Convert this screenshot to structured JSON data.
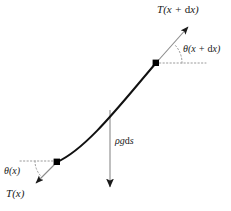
{
  "diagram": {
    "background_color": "#ffffff",
    "width": 231,
    "height": 211,
    "curve_color": "#111111",
    "arrow_color": "#8a8a8a",
    "dotted_color": "#9a9a9a",
    "node_color": "#000000",
    "text_color": "#1a1a1a",
    "labels": {
      "tension_upper": "T(x + dx)",
      "tension_lower": "T(x)",
      "angle_upper": "θ(x + dx)",
      "angle_lower": "θ(x)",
      "weight": "ρgds"
    },
    "label_parts": {
      "tension_upper": {
        "fn": "T",
        "open": "(",
        "var": "x",
        "plus": " + ",
        "d": "d",
        "dvar": "x",
        "close": ")"
      },
      "tension_lower": {
        "fn": "T",
        "open": "(",
        "var": "x",
        "close": ")"
      },
      "angle_upper": {
        "fn": "θ",
        "open": "(",
        "var": "x",
        "plus": " + ",
        "d": "d",
        "dvar": "x",
        "close": ")"
      },
      "angle_lower": {
        "fn": "θ",
        "open": "(",
        "var": "x",
        "close": ")"
      },
      "weight": {
        "rho": "ρ",
        "g": "g",
        "d": "d",
        "s": "s"
      }
    },
    "geometry": {
      "node_lower": {
        "x": 57,
        "y": 162
      },
      "node_upper": {
        "x": 156,
        "y": 63
      },
      "curve_control_1": {
        "x": 88,
        "y": 148
      },
      "curve_control_2": {
        "x": 124,
        "y": 100
      },
      "tension_upper_arrow": {
        "x1": 156,
        "y1": 63,
        "x2": 192,
        "y2": 23
      },
      "tension_lower_arrow": {
        "x1": 57,
        "y1": 162,
        "x2": 33,
        "y2": 186
      },
      "weight_arrow": {
        "x1": 110,
        "y1": 110,
        "x2": 110,
        "y2": 192
      },
      "dotted_upper": {
        "x1": 156,
        "y1": 63,
        "x2": 206,
        "y2": 63
      },
      "dotted_lower": {
        "x1": 20,
        "y1": 161,
        "x2": 57,
        "y2": 161
      },
      "arc_upper_radius": 26,
      "arc_lower_radius": 22
    }
  }
}
